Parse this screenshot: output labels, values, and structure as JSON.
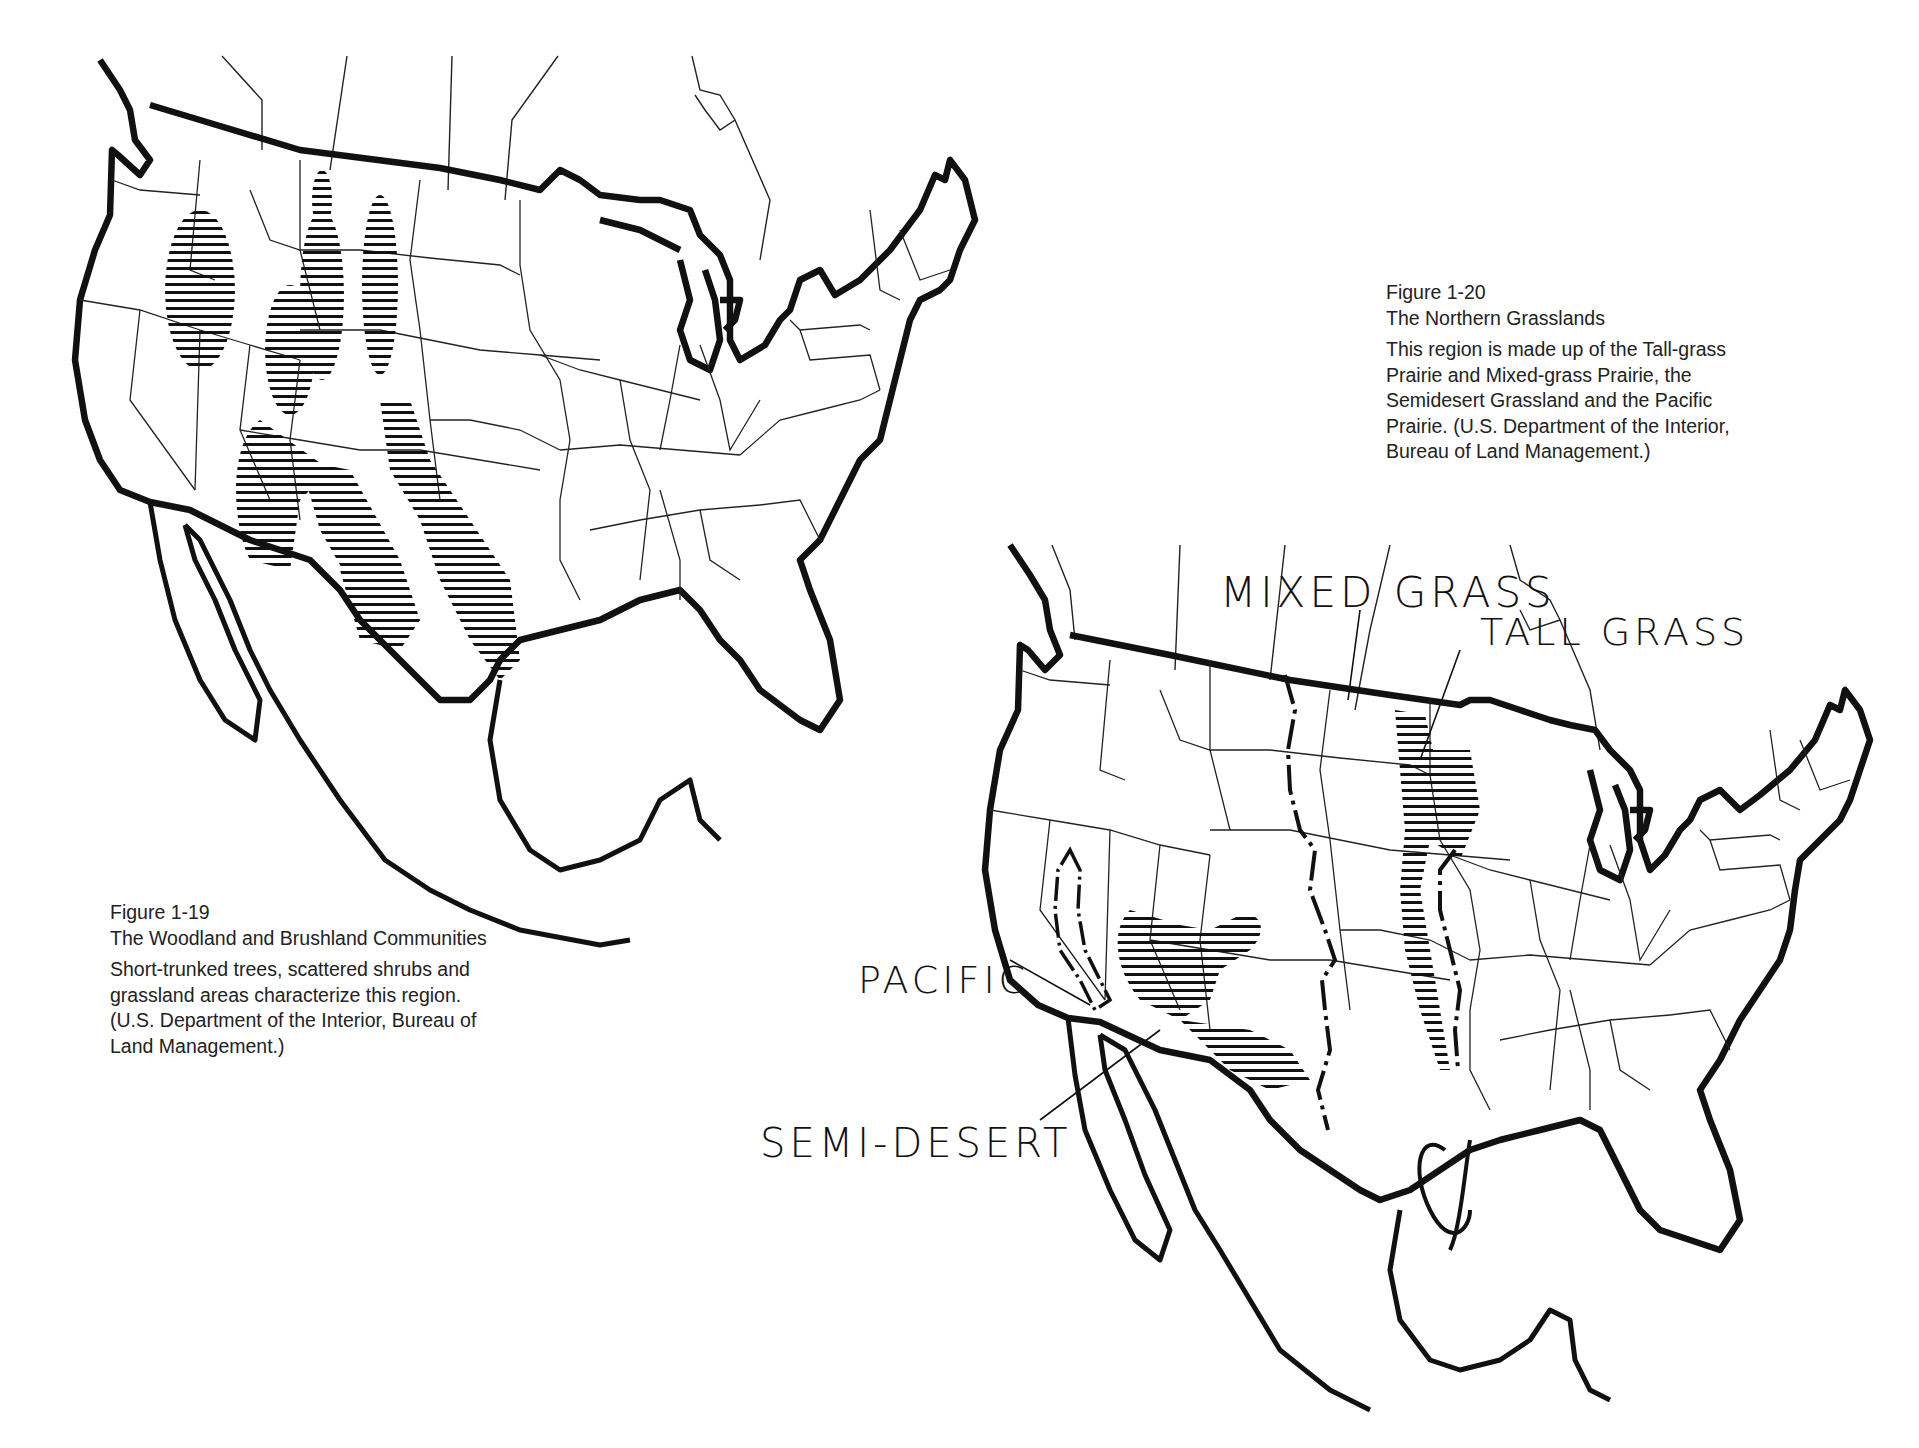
{
  "page": {
    "background": "#ffffff",
    "ink": "#111111"
  },
  "figure_1_19": {
    "number": "Figure 1-19",
    "title": "The Woodland and Brushland Communities",
    "body_lines": [
      "Short-trunked trees, scattered shrubs and",
      "grassland areas characterize this region.",
      "(U.S. Department of the Interior, Bureau of",
      "Land Management.)"
    ],
    "map_type": "line-map-usa-with-hatched-regions"
  },
  "figure_1_20": {
    "number": "Figure 1-20",
    "title": "The Northern Grasslands",
    "body_lines": [
      "This region is made up of the Tall-grass",
      "Prairie and Mixed-grass Prairie, the",
      "Semidesert Grassland and the Pacific",
      "Prairie. (U.S. Department of the Interior,",
      "Bureau of Land Management.)"
    ],
    "map_type": "line-map-usa-with-hatched-regions",
    "handwritten_labels": {
      "mixed_grass": "MIXED GRASS",
      "tall_grass": "TALL GRASS",
      "pacific": "PACIFIC",
      "semi_desert": "SEMI-DESERT"
    }
  }
}
